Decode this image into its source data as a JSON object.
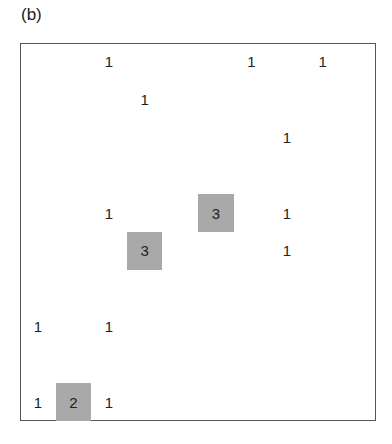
{
  "panel_label": "(b)",
  "grid": {
    "rows": 10,
    "cols": 10,
    "shade_color": "#a9a9a9",
    "border_color": "#555555",
    "cells": [
      {
        "row": 0,
        "col": 2,
        "value": "1",
        "shaded": false
      },
      {
        "row": 0,
        "col": 6,
        "value": "1",
        "shaded": false
      },
      {
        "row": 0,
        "col": 8,
        "value": "1",
        "shaded": false
      },
      {
        "row": 1,
        "col": 3,
        "value": "1",
        "shaded": false
      },
      {
        "row": 2,
        "col": 7,
        "value": "1",
        "shaded": false
      },
      {
        "row": 4,
        "col": 2,
        "value": "1",
        "shaded": false
      },
      {
        "row": 4,
        "col": 5,
        "value": "3",
        "shaded": true
      },
      {
        "row": 4,
        "col": 7,
        "value": "1",
        "shaded": false
      },
      {
        "row": 5,
        "col": 3,
        "value": "3",
        "shaded": true
      },
      {
        "row": 5,
        "col": 7,
        "value": "1",
        "shaded": false
      },
      {
        "row": 7,
        "col": 0,
        "value": "1",
        "shaded": false
      },
      {
        "row": 7,
        "col": 2,
        "value": "1",
        "shaded": false
      },
      {
        "row": 9,
        "col": 0,
        "value": "1",
        "shaded": false
      },
      {
        "row": 9,
        "col": 1,
        "value": "2",
        "shaded": true
      },
      {
        "row": 9,
        "col": 2,
        "value": "1",
        "shaded": false
      }
    ]
  }
}
